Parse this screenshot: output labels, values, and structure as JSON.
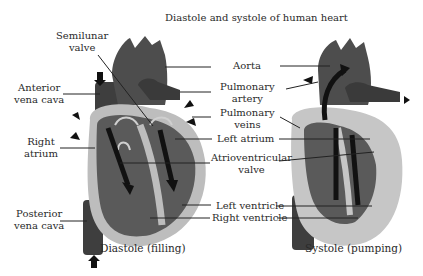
{
  "title": "Diastole and systole of human heart",
  "left_labels": {
    "semilunar_1": "Semilunar",
    "semilunar_2": "valve",
    "anterior_1": "Anterior",
    "anterior_2": "vena cava",
    "right_atrium_1": "Right",
    "right_atrium_2": "atrium",
    "posterior_1": "Posterior",
    "posterior_2": "vena cava"
  },
  "center_labels": {
    "aorta": "Aorta",
    "pulm_artery_1": "Pulmonary",
    "pulm_artery_2": "artery",
    "pulm_veins_1": "Pulmonary",
    "pulm_veins_2": "veins",
    "left_atrium": "Left atrium",
    "av_valve_1": "Atrioventricular",
    "av_valve_2": "valve",
    "left_ventricle": "Left ventricle",
    "right_ventricle": "Right ventricle"
  },
  "captions": {
    "diastole": "Diastole (filling)",
    "systole": "Systole (pumping)"
  },
  "colors": {
    "heart_dark": "#4a4a4a",
    "heart_mid": "#5e5e5e",
    "heart_light": "#bdbdbd",
    "vessel": "#3a3a3a",
    "arrow": "#111111"
  }
}
